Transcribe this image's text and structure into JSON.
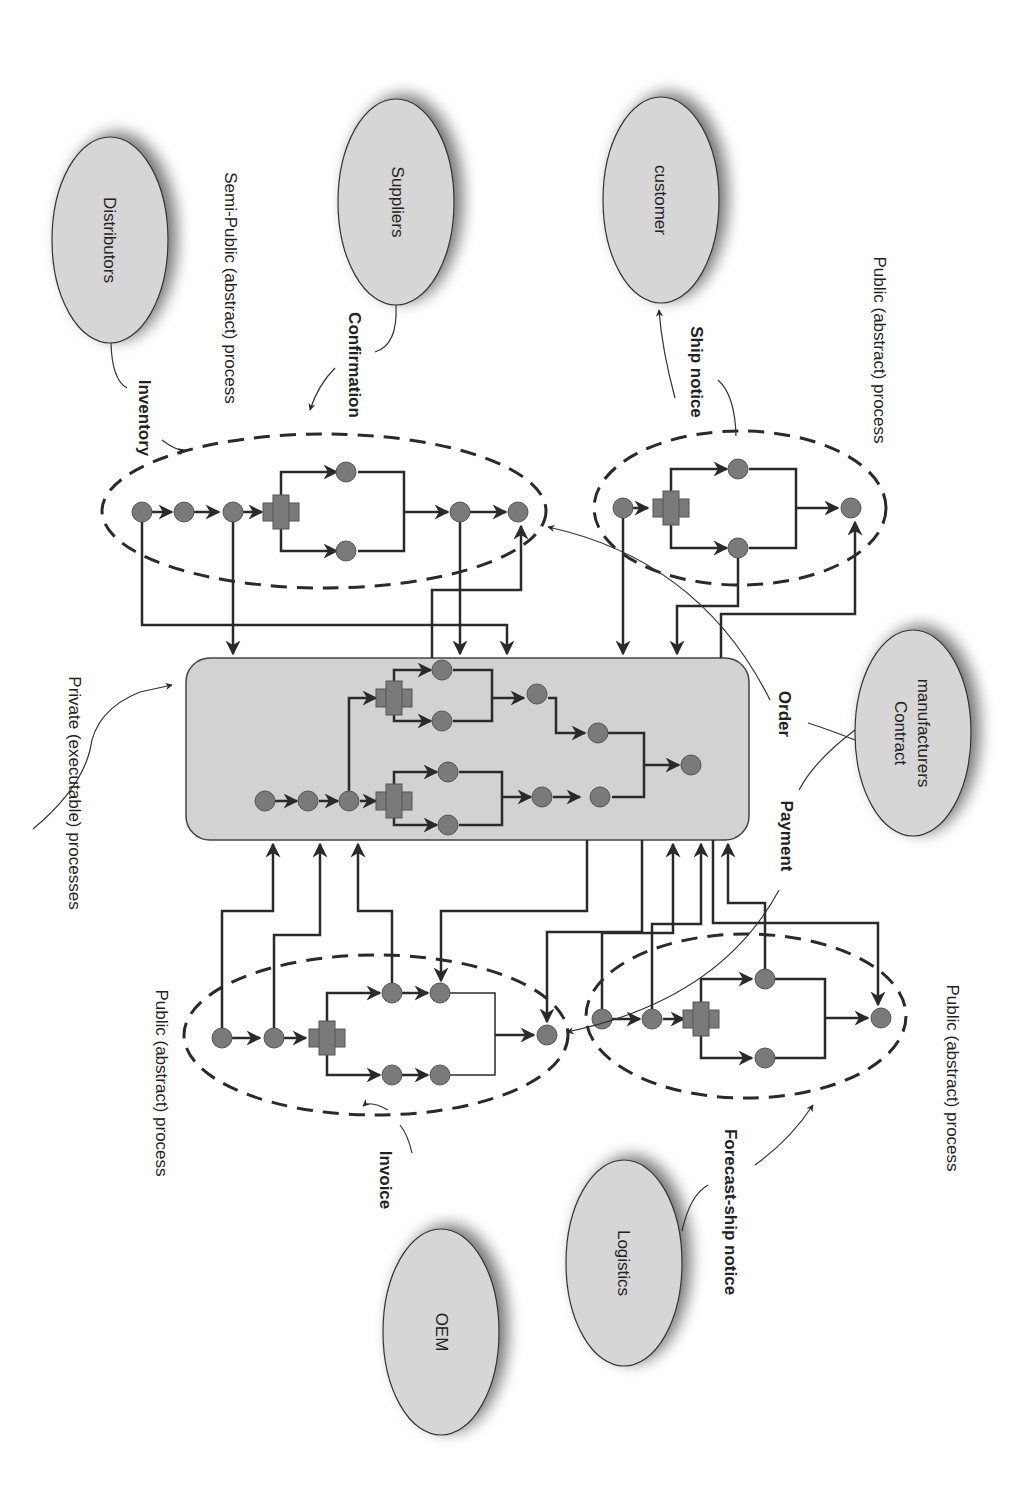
{
  "diagram": {
    "title": "",
    "orientation": "rotated 90deg clockwise",
    "colors": {
      "ellipse_fill": "#d6d6d6",
      "private_box_fill": "#d2d2d2",
      "node_fill": "#7a7a7a",
      "line": "#2a2a2a",
      "background": "#ffffff"
    },
    "partners": {
      "distributors": "Distributors",
      "suppliers": "Suppliers",
      "customer": "customer",
      "contract_manufacturers_line1": "Contract",
      "contract_manufacturers_line2": "manufacturers",
      "oem": "OEM",
      "logistics": "Logistics"
    },
    "messages": {
      "inventory": "Inventory",
      "confirmation": "Confirmation",
      "ship_notice": "Ship notice",
      "order": "Order",
      "payment": "Payment",
      "invoice": "Invoice",
      "forecast_ship_notice": "Forecast-ship notice"
    },
    "process_labels": {
      "semi_public": "Semi-Public (abstract) process",
      "public_top_right": "Public (abstract) process",
      "private": "Private (executable) processes",
      "public_left": "Public (abstract) process",
      "public_bottom_right": "Public (abstract) process"
    }
  }
}
